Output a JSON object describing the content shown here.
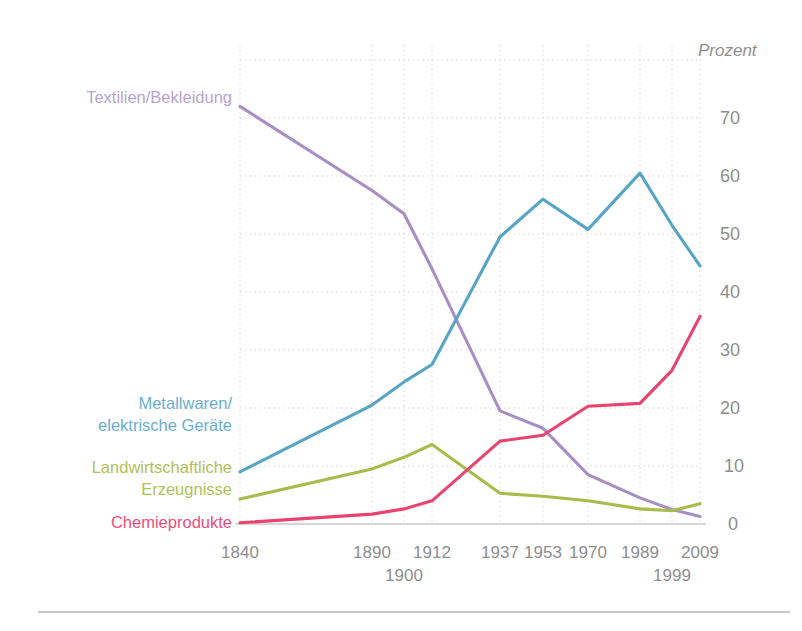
{
  "chart_data": {
    "type": "line",
    "title": "",
    "subtitle": "",
    "xlabel": "",
    "ylabel": "Prozent",
    "unit_label": "Prozent",
    "grid": true,
    "legend_position": "left-inline",
    "categories": [
      "1840",
      "1890",
      "1900",
      "1912",
      "1937",
      "1953",
      "1970",
      "1989",
      "1999",
      "2009"
    ],
    "x_tick_labels_row1": [
      "1840",
      "1890",
      "1912",
      "1937",
      "1953",
      "1970",
      "1989",
      "2009"
    ],
    "x_tick_labels_row2": [
      "1900",
      "1999"
    ],
    "y_tick_labels": [
      "0",
      "10",
      "20",
      "30",
      "40",
      "50",
      "60",
      "70"
    ],
    "y_tick_values": [
      0,
      10,
      20,
      30,
      40,
      50,
      60,
      70
    ],
    "ylim": [
      0,
      80
    ],
    "series": [
      {
        "name": "Textilien/Bekleidung",
        "color": "#a98ec4",
        "label_color": "#b9a3d0",
        "values": [
          72.0,
          57.5,
          53.5,
          44.0,
          19.5,
          16.5,
          8.5,
          4.5,
          2.5,
          1.3
        ]
      },
      {
        "name": "Metallwaren/\nelektrische Geräte",
        "color": "#58a4c5",
        "label_color": "#6aaecd",
        "values": [
          9.0,
          20.5,
          24.5,
          27.5,
          49.5,
          56.0,
          50.8,
          60.5,
          51.5,
          44.5
        ]
      },
      {
        "name": "Landwirtschaftliche\nErzeugnisse",
        "color": "#a7bc4a",
        "label_color": "#b0c159",
        "values": [
          4.3,
          9.5,
          11.5,
          13.7,
          5.3,
          4.8,
          4.0,
          2.6,
          2.3,
          3.5
        ]
      },
      {
        "name": "Chemieprodukte",
        "color": "#e8446f",
        "label_color": "#ea4f77",
        "values": [
          0.2,
          1.7,
          2.6,
          4.0,
          14.3,
          15.3,
          20.3,
          20.8,
          26.5,
          35.8
        ]
      }
    ],
    "legend_entries": [
      {
        "label": "Textilien/Bekleidung",
        "color": "#b9a3d0"
      },
      {
        "label_line1": "Metallwaren/",
        "label_line2": "elektrische Geräte",
        "color": "#6aaecd"
      },
      {
        "label_line1": "Landwirtschaftliche",
        "label_line2": "Erzeugnisse",
        "color": "#b0c159"
      },
      {
        "label": "Chemieprodukte",
        "color": "#ea4f77"
      }
    ]
  },
  "labels": {
    "unit": "Prozent",
    "textilien": "Textilien/Bekleidung",
    "metall_l1": "Metallwaren/",
    "metall_l2": "elektrische Geräte",
    "landwirt_l1": "Landwirtschaftliche",
    "landwirt_l2": "Erzeugnisse",
    "chemie": "Chemieprodukte",
    "y0": "0",
    "y10": "10",
    "y20": "20",
    "y30": "30",
    "y40": "40",
    "y50": "50",
    "y60": "60",
    "y70": "70",
    "x1840": "1840",
    "x1890": "1890",
    "x1900": "1900",
    "x1912": "1912",
    "x1937": "1937",
    "x1953": "1953",
    "x1970": "1970",
    "x1989": "1989",
    "x1999": "1999",
    "x2009": "2009"
  },
  "colors": {
    "purple": "#a98ec4",
    "blue": "#58a4c5",
    "green": "#a7bc4a",
    "pink": "#e8446f",
    "grid": "#d9d9de",
    "axis_text": "#8e8e8e",
    "baseline": "#c9c9c9",
    "footer_rule": "#b7b7b7",
    "background": "#ffffff"
  }
}
